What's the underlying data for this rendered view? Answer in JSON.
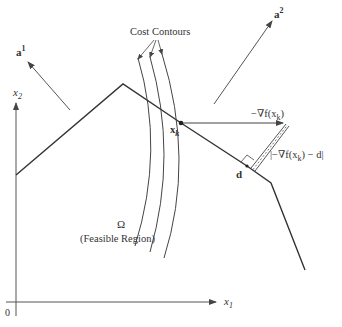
{
  "figure": {
    "type": "feasible-direction projection diagram",
    "labels": {
      "cost_contours": "Cost Contours",
      "a1": "a",
      "a1_sup": "1",
      "a2": "a",
      "a2_sup": "2",
      "x2_axis": "x",
      "x2_sub": "2",
      "x1_axis": "x",
      "x1_sub": "1",
      "origin": "0",
      "xk": "x",
      "xk_sub": "k",
      "neg_grad": "−∇f(x",
      "neg_grad_sub": "k",
      "neg_grad_close": ")",
      "d": "d",
      "residual": "|−∇f(x",
      "residual_sub": "k",
      "residual_close": ") − d|",
      "omega": "Ω",
      "feasible_region": "(Feasible Region)"
    },
    "colors": {
      "line": "#333333",
      "axis": "#555555",
      "background": "#ffffff"
    },
    "geometry": {
      "boundary_points": [
        [
          16,
          175
        ],
        [
          123,
          84
        ],
        [
          181,
          123
        ],
        [
          247,
          166
        ],
        [
          271,
          183
        ],
        [
          305,
          270
        ]
      ],
      "xk_point": [
        181,
        123
      ],
      "d_point": [
        247,
        166
      ],
      "grad_tip": [
        283,
        123
      ],
      "origin": [
        16,
        302
      ]
    }
  }
}
